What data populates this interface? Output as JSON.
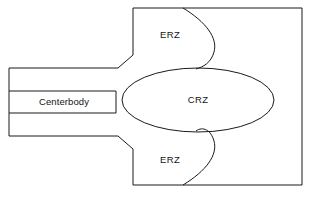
{
  "diagram": {
    "type": "schematic-cross-section",
    "background_color": "#ffffff",
    "line_color": "#1a1a1a",
    "text_color": "#141414",
    "width": 311,
    "height": 197,
    "labels": {
      "erz_upper": "ERZ",
      "erz_lower": "ERZ",
      "crz": "CRZ",
      "centerbody": "Centerbody"
    },
    "label_positions": {
      "erz_upper": {
        "x": 170,
        "y": 35
      },
      "erz_lower": {
        "x": 170,
        "y": 160
      },
      "crz": {
        "x": 198,
        "y": 100
      },
      "centerbody": {
        "x": 64,
        "y": 102
      }
    },
    "geometry": {
      "chamber": {
        "name": "combustion-chamber-outline",
        "left_wall_x": 133,
        "right_wall_x": 302,
        "top_wall_y": 8,
        "bottom_wall_y": 185
      },
      "inlet_duct": {
        "name": "annular-inlet-duct",
        "left_x": 9,
        "top_y": 68,
        "bottom_y": 136,
        "throat_x": 118
      },
      "centerbody": {
        "name": "centerbody-body",
        "left_x": 9,
        "right_x": 116,
        "top_y": 91,
        "bottom_y": 113
      },
      "crz_ellipse": {
        "name": "central-recirculation-zone",
        "center_x": 198,
        "center_y": 100,
        "radius_x": 76,
        "radius_y": 32
      },
      "shear_layer_upper": {
        "name": "upper-shear-layer-curve",
        "start": {
          "x": 183,
          "y": 8
        },
        "end": {
          "x": 196,
          "y": 69
        },
        "bulge_x": 216
      },
      "shear_layer_lower": {
        "name": "lower-shear-layer-curve",
        "start": {
          "x": 183,
          "y": 185
        },
        "end": {
          "x": 196,
          "y": 131
        },
        "bulge_x": 216
      }
    }
  }
}
